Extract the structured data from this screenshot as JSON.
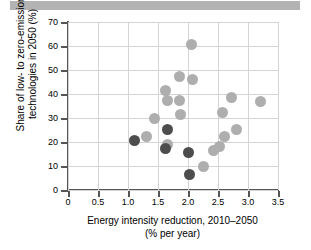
{
  "header": {
    "bar_color": "#b3b3b3"
  },
  "chart_data": {
    "type": "scatter",
    "title": "",
    "xlabel": "Energy intensity reduction, 2010–2050",
    "xlabel_line2": "(% per year)",
    "ylabel": "Share of low- to zero-emission technologies in 2050 (%)",
    "ylabel_line1": "Share of low- to zero-emission",
    "ylabel_line2": "technologies in 2050 (%)",
    "xlim": [
      0,
      3.5
    ],
    "ylim": [
      0,
      70
    ],
    "xticks": [
      0,
      0.5,
      1.0,
      1.5,
      2.0,
      2.5,
      3.0,
      3.5
    ],
    "xtick_labels": [
      "0",
      "0.5",
      "1.0",
      "1.5",
      "2.0",
      "2.5",
      "3.0",
      "3.5"
    ],
    "yticks": [
      0,
      10,
      20,
      30,
      40,
      50,
      60,
      70
    ],
    "ytick_labels": [
      "0",
      "10",
      "20",
      "30",
      "40",
      "50",
      "60",
      "70"
    ],
    "grid": true,
    "legend": "none",
    "colors": {
      "light_marker": "#aeaeae",
      "dark_marker": "#4d4d4d",
      "gridline": "#d4d4d4",
      "axis": "#555555"
    },
    "series": [
      {
        "name": "light",
        "color": "#aeaeae",
        "points": [
          {
            "x": 1.3,
            "y": 22.4
          },
          {
            "x": 1.44,
            "y": 29.8
          },
          {
            "x": 1.63,
            "y": 41.5
          },
          {
            "x": 1.66,
            "y": 37.5
          },
          {
            "x": 1.65,
            "y": 18.8
          },
          {
            "x": 1.85,
            "y": 47.1
          },
          {
            "x": 1.86,
            "y": 37.4
          },
          {
            "x": 1.87,
            "y": 31.3
          },
          {
            "x": 2.05,
            "y": 60.8
          },
          {
            "x": 2.07,
            "y": 46.2
          },
          {
            "x": 2.25,
            "y": 9.8
          },
          {
            "x": 2.42,
            "y": 16.6
          },
          {
            "x": 2.52,
            "y": 18.2
          },
          {
            "x": 2.57,
            "y": 32.5
          },
          {
            "x": 2.6,
            "y": 22.3
          },
          {
            "x": 2.73,
            "y": 38.7
          },
          {
            "x": 2.8,
            "y": 25.3
          },
          {
            "x": 3.2,
            "y": 36.7
          }
        ]
      },
      {
        "name": "dark",
        "color": "#4d4d4d",
        "points": [
          {
            "x": 1.1,
            "y": 20.5
          },
          {
            "x": 1.62,
            "y": 17.4
          },
          {
            "x": 1.66,
            "y": 25.3
          },
          {
            "x": 2.0,
            "y": 15.6
          },
          {
            "x": 2.02,
            "y": 6.4
          }
        ]
      }
    ]
  }
}
